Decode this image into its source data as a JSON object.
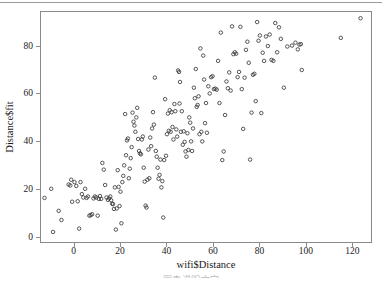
{
  "chart_data": {
    "type": "scatter",
    "title": "",
    "xlabel": "wifi$Distance",
    "ylabel": "Distance$fit",
    "xlim": [
      -14,
      128
    ],
    "ylim": [
      -2,
      94
    ],
    "xticks": [
      0,
      20,
      40,
      60,
      80,
      100,
      120
    ],
    "yticks": [
      0,
      20,
      40,
      60,
      80
    ],
    "grid": false,
    "legend": null,
    "marker": "open-circle",
    "marker_color": "#3a3a3a",
    "n_points": 201,
    "x": [
      -12.5,
      -9.6,
      -8.8,
      -6.4,
      -5.2,
      -2.1,
      -1.4,
      -1.0,
      -0.6,
      0.4,
      1.2,
      1.8,
      2.4,
      3.0,
      3.6,
      4.2,
      5.0,
      5.6,
      6.2,
      6.8,
      7.4,
      8.0,
      8.6,
      9.2,
      9.8,
      10.4,
      10.9,
      11.4,
      11.9,
      12.4,
      13.0,
      13.6,
      14.2,
      14.8,
      15.3,
      15.8,
      16.2,
      16.6,
      17.0,
      17.4,
      17.8,
      18.2,
      18.6,
      19.0,
      19.4,
      19.8,
      20.2,
      20.6,
      21.0,
      21.4,
      21.8,
      22.2,
      22.6,
      23.0,
      23.4,
      23.8,
      24.2,
      24.6,
      25.0,
      25.4,
      25.8,
      26.2,
      26.6,
      27.0,
      27.4,
      27.8,
      28.2,
      28.6,
      29.0,
      29.4,
      29.8,
      30.2,
      30.6,
      31.0,
      31.4,
      31.8,
      32.2,
      32.6,
      33.0,
      33.4,
      33.8,
      34.2,
      34.6,
      35.0,
      35.4,
      35.8,
      36.2,
      36.6,
      37.0,
      37.4,
      37.8,
      38.2,
      38.6,
      39.0,
      39.4,
      39.8,
      40.2,
      40.6,
      41.0,
      41.4,
      41.8,
      42.2,
      42.6,
      43.0,
      43.4,
      43.8,
      44.2,
      44.6,
      45.0,
      45.4,
      45.8,
      46.2,
      46.6,
      47.0,
      47.4,
      47.8,
      48.2,
      48.6,
      49.0,
      49.4,
      49.8,
      50.2,
      50.6,
      51.0,
      51.4,
      51.8,
      52.2,
      52.6,
      53.0,
      53.4,
      53.8,
      54.2,
      54.6,
      55.0,
      55.4,
      55.8,
      56.2,
      56.6,
      57.0,
      57.4,
      58.0,
      58.6,
      59.2,
      59.8,
      60.4,
      61.0,
      61.6,
      62.2,
      62.8,
      63.4,
      64.0,
      64.6,
      65.2,
      65.8,
      66.4,
      67.0,
      67.6,
      68.2,
      68.8,
      69.4,
      70.0,
      70.6,
      71.2,
      71.8,
      72.4,
      73.0,
      73.6,
      74.2,
      74.8,
      75.4,
      76.0,
      76.6,
      77.2,
      77.8,
      78.4,
      79.0,
      79.6,
      80.2,
      80.8,
      81.4,
      82.0,
      82.8,
      83.6,
      84.4,
      85.2,
      86.0,
      86.8,
      87.6,
      88.4,
      89.2,
      90.5,
      92.0,
      94.0,
      95.5,
      96.5,
      97.2,
      97.8,
      98.2,
      115.0,
      123.5,
      45.6
    ],
    "y": [
      16.4,
      20.2,
      2.2,
      11.0,
      7.2,
      22.0,
      21.6,
      24.0,
      14.8,
      23.0,
      21.4,
      15.0,
      3.6,
      23.0,
      18.0,
      16.6,
      20.2,
      16.4,
      17.0,
      9.0,
      9.2,
      9.6,
      16.2,
      17.0,
      16.6,
      9.0,
      16.0,
      17.2,
      16.0,
      31.0,
      28.2,
      21.8,
      16.6,
      15.6,
      16.2,
      17.0,
      15.4,
      14.0,
      13.8,
      11.8,
      20.8,
      3.2,
      12.0,
      28.0,
      21.0,
      13.0,
      19.0,
      5.8,
      23.0,
      25.6,
      30.0,
      51.4,
      34.2,
      40.4,
      41.2,
      24.6,
      28.6,
      33.0,
      37.6,
      52.0,
      48.2,
      46.6,
      44.0,
      50.0,
      54.0,
      41.0,
      36.0,
      35.0,
      34.6,
      40.8,
      42.0,
      29.0,
      23.2,
      13.2,
      12.4,
      24.0,
      36.6,
      24.6,
      41.6,
      38.0,
      45.4,
      52.2,
      47.0,
      66.6,
      36.0,
      33.6,
      29.0,
      24.4,
      26.0,
      32.4,
      20.8,
      23.4,
      8.2,
      32.2,
      57.6,
      34.0,
      43.0,
      51.6,
      44.4,
      53.0,
      44.0,
      52.2,
      46.0,
      40.8,
      55.6,
      52.6,
      45.0,
      42.0,
      69.6,
      69.0,
      64.8,
      44.0,
      52.6,
      38.6,
      44.2,
      39.8,
      35.8,
      33.6,
      43.4,
      36.4,
      50.0,
      47.8,
      40.0,
      36.0,
      45.4,
      62.4,
      58.0,
      70.2,
      54.4,
      55.2,
      58.8,
      43.0,
      78.8,
      44.0,
      40.0,
      75.8,
      65.8,
      47.6,
      56.0,
      43.6,
      63.0,
      60.0,
      66.8,
      67.2,
      61.8,
      62.0,
      61.6,
      73.6,
      56.0,
      85.4,
      32.2,
      35.8,
      51.0,
      65.0,
      62.2,
      68.8,
      61.2,
      88.0,
      76.4,
      77.2,
      76.6,
      66.8,
      69.0,
      87.8,
      61.8,
      45.2,
      66.6,
      78.2,
      81.6,
      72.8,
      32.4,
      52.0,
      67.8,
      68.2,
      56.8,
      89.8,
      82.0,
      84.2,
      51.8,
      77.0,
      73.6,
      83.8,
      79.8,
      84.6,
      74.0,
      73.6,
      89.4,
      77.2,
      87.6,
      82.8,
      62.4,
      79.6,
      80.0,
      81.2,
      78.4,
      80.4,
      80.6,
      69.8,
      83.2,
      91.4,
      55.8
    ]
  },
  "axes": {
    "x_label": "wifi$Distance",
    "y_label": "Distance$fit",
    "x_tick_labels": [
      "0",
      "20",
      "40",
      "60",
      "80",
      "100",
      "120"
    ],
    "y_tick_labels": [
      "0",
      "20",
      "40",
      "60",
      "80"
    ]
  },
  "caption": {
    "text": "图表说明文字"
  }
}
